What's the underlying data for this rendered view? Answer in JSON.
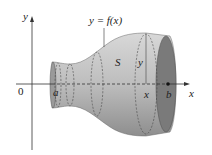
{
  "diagram": {
    "labels": {
      "curve": "y = f(x)",
      "solid": "S",
      "radius": "y",
      "origin": "0",
      "a": "a",
      "b": "b",
      "x_point": "x",
      "x_axis": "x",
      "y_axis": "y"
    },
    "colors": {
      "solid_fill": "#a8a8a8",
      "end_cap": "#7a7a7a",
      "axis": "#333333"
    }
  }
}
